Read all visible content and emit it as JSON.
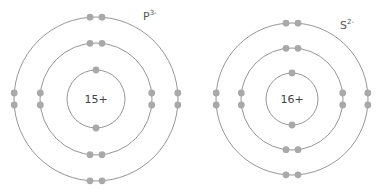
{
  "diagram": {
    "type": "bohr-model-comparison",
    "atoms": [
      {
        "id": "phosphide",
        "symbol": "P",
        "charge": "3-",
        "nucleus_label": "15+",
        "center": [
          96,
          99
        ],
        "shell_radii": [
          29,
          56,
          82
        ],
        "electrons_per_shell": [
          2,
          8,
          8
        ],
        "label_pos": [
          143,
          20
        ]
      },
      {
        "id": "sulfide",
        "symbol": "S",
        "charge": "2-",
        "nucleus_label": "16+",
        "center": [
          292,
          99
        ],
        "shell_radii": [
          26,
          51,
          76
        ],
        "electrons_per_shell": [
          2,
          8,
          8
        ],
        "label_pos": [
          340,
          29
        ]
      }
    ],
    "colors": {
      "shell": "#8a8a8a",
      "electron": "#a9a9a9",
      "text": "#444444"
    }
  }
}
